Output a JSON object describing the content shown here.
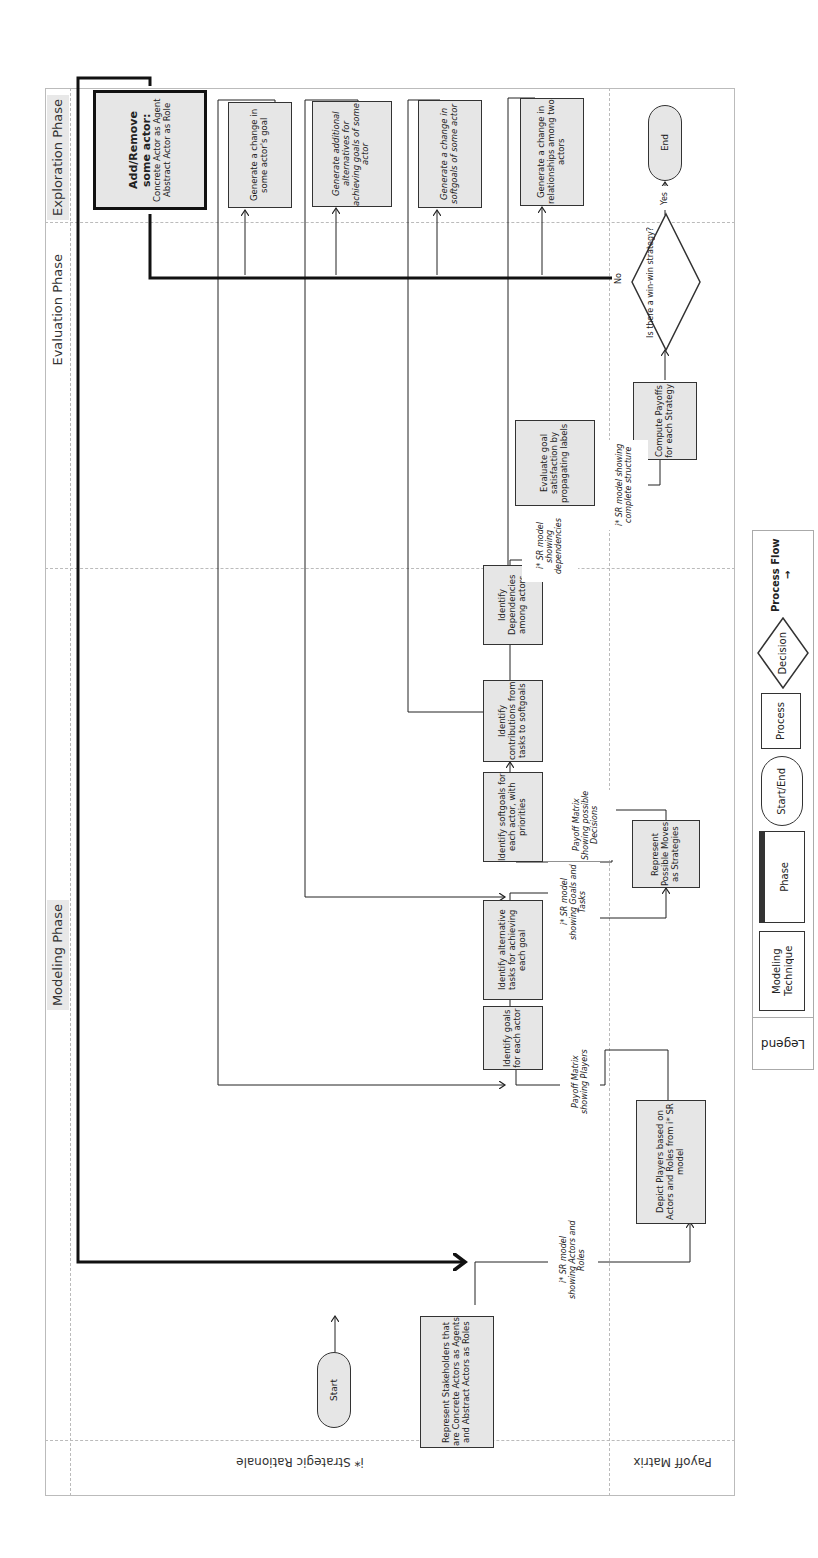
{
  "phases": {
    "exploration": "Exploration Phase",
    "evaluation": "Evaluation Phase",
    "modeling": "Modeling Phase"
  },
  "lanes": {
    "strategic_rationale": "i* Strategic Rationale",
    "payoff_matrix": "Payoff Matrix"
  },
  "nodes": {
    "start": "Start",
    "represent_stakeholders": "Represent Stakeholders that are Concrete Actors as Agents and Abstract Actors as Roles",
    "identify_goals": "Identify goals for each actor",
    "identify_tasks": "Identify alternative tasks for achieving each goal",
    "identify_softgoals": "Identify softgoals for each actor, with priorities",
    "identify_contributions": "Identify contributions from tasks to softgoals",
    "identify_dependencies": "Identify Dependencies among actors",
    "evaluate_goal": "Evaluate goal satisfaction by propagating labels",
    "depict_players": "Depict Players based on Actors and Roles from i* SR model",
    "represent_moves": "Represent Possible Moves as Strategies",
    "compute_payoffs": "Compute Payoffs for each Strategy",
    "decision": "Is there a win-win strategy?",
    "end": "End",
    "add_remove_actor_title": "Add/Remove some actor:",
    "add_remove_actor_body": "Concrete Actor as Agent Abstract Actor as Role",
    "change_goal": "Generate a change in some actor's goal",
    "additional_alternatives": "Generate additional alternatives for achieving goals of some actor",
    "change_softgoals": "Generate a change in softgoals of some actor",
    "change_relationships": "Generate a change in relationships among two actors"
  },
  "annotations": {
    "sr_actors_roles": "i* SR model showing Actors and Roles",
    "payoff_players": "Payoff Matrix showing Players",
    "sr_goals_tasks": "i* SR model showing Goals and Tasks",
    "payoff_decisions": "Payoff Matrix Showing possible Decisions",
    "sr_dependencies": "i* SR model showing dependencies",
    "sr_complete": "i* SR model showing complete structure",
    "yes": "Yes",
    "no": "No"
  },
  "legend": {
    "title": "Legend",
    "modeling_technique": "Modeling Technique",
    "phase": "Phase",
    "start_end": "Start/End",
    "process": "Process",
    "decision": "Decision",
    "process_flow": "Process Flow"
  },
  "colors": {
    "box_fill": "#e6e6e6",
    "stroke": "#333333",
    "divider": "#bbbbbb"
  }
}
